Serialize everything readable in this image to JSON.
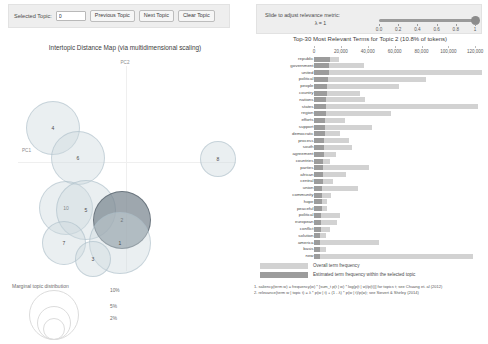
{
  "controls": {
    "selected_topic_label": "Selected Topic:",
    "selected_topic_value": "0",
    "previous_topic": "Previous Topic",
    "next_topic": "Next Topic",
    "clear_topic": "Clear Topic"
  },
  "lambda": {
    "instruction": "Slide to adjust relevance metric:",
    "symbol": "λ = 1",
    "value": 1,
    "ticks": [
      "0.0",
      "0.2",
      "0.4",
      "0.6",
      "0.8",
      "1"
    ]
  },
  "left_panel": {
    "title": "Intertopic Distance Map (via multidimensional scaling)",
    "x_axis_label": "PC2",
    "y_axis_label": "PC1",
    "legend_title": "Marginal topic distribution",
    "legend_sizes": [
      "2%",
      "5%",
      "10%"
    ]
  },
  "scatter_data": {
    "type": "scatter",
    "selected_topic": 2,
    "topics": [
      {
        "id": 4,
        "cx": 53,
        "cy": 98,
        "r": 27,
        "selected": false
      },
      {
        "id": 6,
        "cx": 78,
        "cy": 128,
        "r": 27,
        "selected": false
      },
      {
        "id": 8,
        "cx": 218,
        "cy": 129,
        "r": 18,
        "selected": false
      },
      {
        "id": 10,
        "cx": 66,
        "cy": 178,
        "r": 27,
        "selected": false
      },
      {
        "id": 5,
        "cx": 86,
        "cy": 180,
        "r": 30,
        "selected": false
      },
      {
        "id": 2,
        "cx": 122,
        "cy": 190,
        "r": 29,
        "selected": true
      },
      {
        "id": 1,
        "cx": 120,
        "cy": 213,
        "r": 31,
        "selected": false
      },
      {
        "id": 7,
        "cx": 64,
        "cy": 213,
        "r": 22,
        "selected": false
      },
      {
        "id": 3,
        "cx": 93,
        "cy": 229,
        "r": 18,
        "selected": false
      }
    ]
  },
  "right_panel": {
    "title": "Top-30 Most Relevant Terms for Topic 2 (10.8% of tokens)",
    "legend_overall": "Overall term frequency",
    "legend_topic": "Estimated term frequency within the selected topic",
    "footnote_1": "1. saliency(term w) = frequency(w) * [sum_t p(t | w) * log(p(t | w)/p(t))] for topics t; see Chuang et. al (2012)",
    "footnote_2": "2. relevance(term w | topic t) = λ * p(w | t) + (1 - λ) * p(w | t)/p(w); see Sievert & Shirley (2014)"
  },
  "chart_data": {
    "type": "bar",
    "orientation": "horizontal",
    "title": "Top-30 Most Relevant Terms for Topic 2 (10.8% of tokens)",
    "xlabel": "",
    "ylabel": "",
    "xlim": [
      0,
      128000
    ],
    "xticks": [
      0,
      20000,
      40000,
      60000,
      80000,
      100000,
      120000
    ],
    "xtick_labels": [
      "0",
      "20,000",
      "40,000",
      "60,000",
      "80,000",
      "100,000",
      "120,000"
    ],
    "grid": false,
    "legend_position": "bottom-left",
    "categories": [
      "republic",
      "government",
      "united",
      "political",
      "people",
      "country",
      "nations",
      "states",
      "region",
      "efforts",
      "support",
      "democratic",
      "process",
      "south",
      "agreement",
      "countries",
      "parties",
      "african",
      "central",
      "union",
      "community",
      "hope",
      "peaceful",
      "political",
      "european",
      "conflict",
      "solution",
      "america",
      "basis",
      "new"
    ],
    "series": [
      {
        "name": "Overall term frequency",
        "values": [
          18500,
          37000,
          125000,
          83000,
          63000,
          34000,
          38000,
          122000,
          57000,
          23000,
          43000,
          19000,
          26000,
          28000,
          16000,
          12000,
          41000,
          24000,
          14000,
          33000,
          13000,
          10000,
          9500,
          19000,
          17000,
          12000,
          9000,
          48000,
          9000,
          118000
        ]
      },
      {
        "name": "Estimated term frequency within the selected topic",
        "values": [
          12000,
          11500,
          11000,
          10500,
          10000,
          9500,
          9200,
          9000,
          8700,
          8400,
          8100,
          7900,
          7600,
          7400,
          7200,
          7000,
          6800,
          6600,
          6400,
          6200,
          6000,
          5800,
          5600,
          5400,
          5200,
          5000,
          4800,
          4600,
          4400,
          4200
        ]
      }
    ]
  }
}
